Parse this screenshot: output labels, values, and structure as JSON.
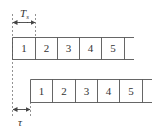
{
  "diagram": {
    "colors": {
      "line": "#555555",
      "dash": "#777777",
      "text": "#333333",
      "background": "#ffffff"
    },
    "symbol_period": {
      "label": "T",
      "subscript": "s"
    },
    "delay": {
      "label": "τ"
    },
    "top_row": {
      "cells": [
        "1",
        "2",
        "3",
        "4",
        "5",
        ""
      ]
    },
    "bottom_row": {
      "cells": [
        "1",
        "2",
        "3",
        "4",
        "5",
        ""
      ]
    }
  }
}
